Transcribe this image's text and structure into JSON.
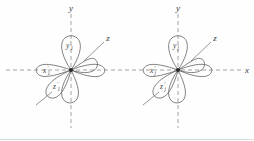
{
  "figure": {
    "name": "hybrid-orbital-pair-diagram",
    "background": "#fefefe",
    "width": 254,
    "height": 141,
    "stroke_color": "#5a5a5a",
    "axis_color": "#8d8d8d",
    "label_color": "#3a3a3a"
  },
  "diagrams": [
    {
      "id": "left",
      "center": {
        "x": 71,
        "y": 70
      },
      "axis_labels": {
        "y": "y",
        "z": "z",
        "x": ""
      },
      "orbital_labels": {
        "y": {
          "base": "y",
          "sub": "1",
          "prime": "′"
        },
        "x": {
          "base": "x",
          "sub": "1",
          "prime": "′"
        },
        "z": {
          "base": "z",
          "sub": "1",
          "prime": "′"
        }
      }
    },
    {
      "id": "right",
      "center": {
        "x": 178,
        "y": 70
      },
      "axis_labels": {
        "y": "y",
        "z": "z",
        "x": "x"
      },
      "orbital_labels": {
        "y": {
          "base": "y",
          "sub": "j",
          "prime": "′"
        },
        "x": {
          "base": "x",
          "sub": "j",
          "prime": "′"
        },
        "z": {
          "base": "z",
          "sub": "j",
          "prime": "′"
        }
      }
    }
  ],
  "lobes": {
    "count_per_diagram": 6,
    "angles_deg": [
      90,
      35,
      0,
      300,
      215,
      180
    ],
    "shape": "teardrop"
  }
}
